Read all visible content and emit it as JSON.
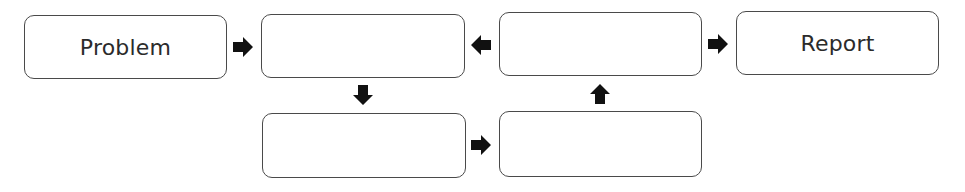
{
  "diagram": {
    "type": "flowchart",
    "boxes": [
      {
        "id": "problem",
        "label": "Problem"
      },
      {
        "id": "step-1",
        "label": ""
      },
      {
        "id": "step-4",
        "label": ""
      },
      {
        "id": "report",
        "label": "Report"
      },
      {
        "id": "step-2",
        "label": ""
      },
      {
        "id": "step-3",
        "label": ""
      }
    ],
    "arrows": [
      {
        "from": "problem",
        "to": "step-1",
        "direction": "right"
      },
      {
        "from": "step-1",
        "to": "step-2",
        "direction": "down"
      },
      {
        "from": "step-2",
        "to": "step-3",
        "direction": "right"
      },
      {
        "from": "step-3",
        "to": "step-4",
        "direction": "up"
      },
      {
        "from": "step-4",
        "to": "step-1",
        "direction": "left"
      },
      {
        "from": "step-4",
        "to": "report",
        "direction": "right"
      }
    ],
    "colors": {
      "border": "#4a4a4a",
      "arrow": "#111111",
      "text": "#2b2b2b",
      "background": "#ffffff"
    }
  }
}
